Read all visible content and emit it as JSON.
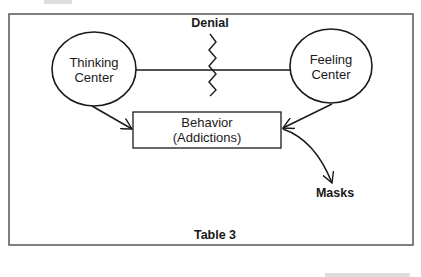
{
  "diagram": {
    "title_label": "Denial",
    "nodes": {
      "thinking": {
        "line1": "Thinking",
        "line2": "Center"
      },
      "feeling": {
        "line1": "Feeling",
        "line2": "Center"
      },
      "behavior": {
        "line1": "Behavior",
        "line2": "(Addictions)"
      },
      "masks": {
        "label": "Masks"
      }
    },
    "edges": [
      {
        "from": "thinking",
        "to": "feeling",
        "type": "line",
        "crossed_by": "Denial"
      },
      {
        "from": "thinking",
        "to": "behavior",
        "type": "arrow"
      },
      {
        "from": "feeling",
        "to": "behavior",
        "type": "arrow"
      },
      {
        "from": "behavior",
        "to": "masks",
        "type": "curved-arrow"
      }
    ],
    "caption": "Table 3",
    "colors": {
      "stroke": "#1a1a1a",
      "frame": "#555555",
      "background": "#ffffff"
    }
  }
}
